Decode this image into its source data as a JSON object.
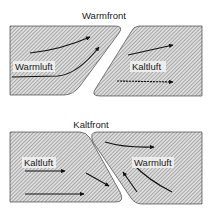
{
  "diagram": {
    "top": {
      "title": "Warmfront",
      "left_label": "Warmluft",
      "right_label": "Kaltluft"
    },
    "bottom": {
      "title": "Kaltfront",
      "left_label": "Kaltluft",
      "right_label": "Warmluft"
    }
  },
  "colors": {
    "hatch_line": "#8a8a8a",
    "hatch_bg": "#d8d8d8",
    "outline": "#2a2a2a",
    "arrow": "#111111",
    "background": "#ffffff"
  }
}
